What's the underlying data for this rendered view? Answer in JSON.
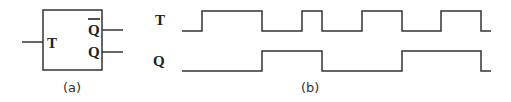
{
  "figure_a": {
    "caption": "(a)",
    "input_label": "T",
    "output_top_label": "Q",
    "output_top_overbar": true,
    "output_bottom_label": "Q"
  },
  "figure_b": {
    "caption": "(b)",
    "signals": [
      {
        "name": "T",
        "edges_x": [
          182,
          262,
          302,
          322,
          362,
          402,
          441,
          481
        ],
        "start_level": "low"
      },
      {
        "name": "Q",
        "edges_x": [
          262,
          322,
          402,
          481
        ],
        "start_level": "low"
      }
    ]
  },
  "colors": {
    "line": "#333333",
    "text": "#222222",
    "background": "#ffffff"
  }
}
